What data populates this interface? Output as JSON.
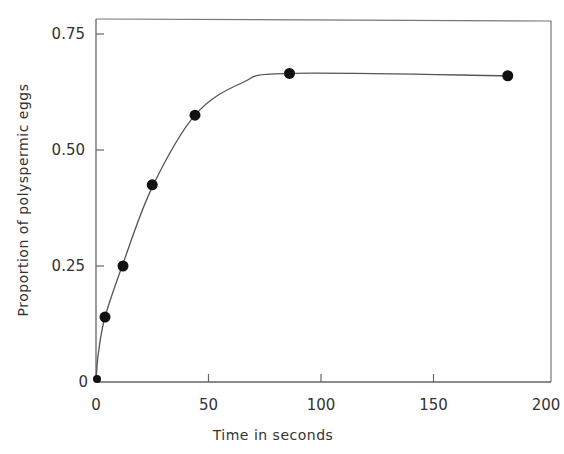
{
  "chart_data": {
    "type": "line",
    "title": "",
    "xlabel": "Time in seconds",
    "ylabel": "Proportion of polyspermic eggs",
    "xlim": [
      0,
      200
    ],
    "ylim": [
      0,
      0.78
    ],
    "x_ticks": [
      0,
      50,
      100,
      150,
      200
    ],
    "x_tick_labels": [
      "0",
      "50",
      "100",
      "150",
      "200"
    ],
    "y_ticks": [
      0,
      0.25,
      0.5,
      0.75
    ],
    "y_tick_labels": [
      "0",
      "0.25",
      "0.50",
      "0.75"
    ],
    "grid": false,
    "legend": null,
    "series": [
      {
        "name": "Polyspermic eggs",
        "marker": "filled-circle",
        "line": "smooth-fit",
        "x": [
          0,
          4,
          12,
          25,
          44,
          86,
          183
        ],
        "values": [
          0.0,
          0.14,
          0.25,
          0.425,
          0.575,
          0.665,
          0.66
        ]
      }
    ],
    "colors": {
      "line": "#555555",
      "marker": "#111111",
      "axis": "#666666"
    }
  }
}
